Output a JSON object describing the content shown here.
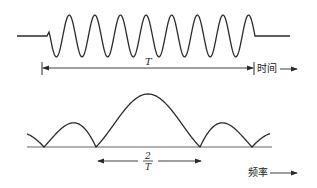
{
  "diagram": {
    "time_panel": {
      "duration_label": "T",
      "axis_label": "时间",
      "cycles": 8
    },
    "frequency_panel": {
      "bandwidth_numerator": "2",
      "bandwidth_denominator": "T",
      "axis_label": "频率"
    },
    "colors": {
      "stroke": "#2a2a2a",
      "baseline": "#555555",
      "background": "#ffffff"
    }
  }
}
